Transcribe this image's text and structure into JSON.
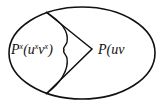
{
  "diagram": {
    "type": "ellipse-partition",
    "stroke_color": "#111111",
    "background": "#ffffff",
    "labels": {
      "left": {
        "base": "P",
        "sup1": "x",
        "open": "(u",
        "sup2": "x",
        "mid": "v",
        "sup3": "x",
        "close": ")"
      },
      "right": {
        "text": "P(uv"
      }
    }
  }
}
